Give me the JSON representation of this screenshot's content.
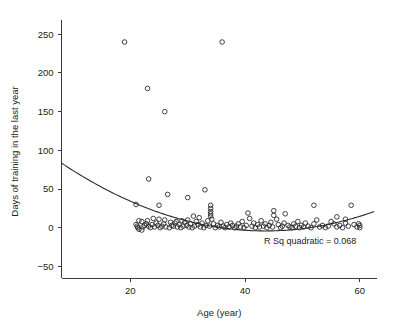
{
  "chart_data": {
    "type": "scatter",
    "title": "",
    "xlabel": "Age (year)",
    "ylabel": "Days of training in the last year",
    "xlim": [
      8,
      63
    ],
    "ylim": [
      -65,
      262
    ],
    "xticks": [
      20,
      40,
      60
    ],
    "yticks": [
      -50,
      0,
      50,
      100,
      150,
      200,
      250
    ],
    "grid": false,
    "legend": null,
    "annotation": "R Sq quadratic = 0.068",
    "marker": "open-circle",
    "fit": {
      "kind": "quadratic",
      "r_squared": 0.068,
      "label": "R Sq quadratic = 0.068",
      "coefficients": {
        "a": 0.0695,
        "b": -6.05,
        "c": 127.5
      },
      "x_start": 8,
      "x_end": 62.5
    },
    "points": [
      [
        19.0,
        240
      ],
      [
        36.0,
        240
      ],
      [
        23.0,
        180
      ],
      [
        26.0,
        150
      ],
      [
        23.2,
        63
      ],
      [
        33.0,
        49
      ],
      [
        26.5,
        43
      ],
      [
        30.0,
        39
      ],
      [
        21.0,
        30
      ],
      [
        25.0,
        29
      ],
      [
        34.0,
        29
      ],
      [
        34.0,
        25
      ],
      [
        34.0,
        21
      ],
      [
        34.0,
        18
      ],
      [
        34.0,
        15
      ],
      [
        40.5,
        19
      ],
      [
        45.0,
        22
      ],
      [
        45.0,
        16
      ],
      [
        47.0,
        18
      ],
      [
        52.0,
        29
      ],
      [
        58.5,
        29
      ],
      [
        56.0,
        14
      ],
      [
        57.5,
        11
      ],
      [
        31.0,
        15
      ],
      [
        32.0,
        13
      ],
      [
        30.0,
        10
      ],
      [
        29.0,
        9
      ],
      [
        28.0,
        8
      ],
      [
        27.0,
        7
      ],
      [
        26.0,
        10
      ],
      [
        25.0,
        11
      ],
      [
        24.0,
        12
      ],
      [
        23.0,
        9
      ],
      [
        22.0,
        8
      ],
      [
        21.5,
        9
      ],
      [
        21.0,
        4
      ],
      [
        21.2,
        2
      ],
      [
        21.3,
        0
      ],
      [
        21.5,
        -2
      ],
      [
        22.0,
        -3
      ],
      [
        22.2,
        1
      ],
      [
        22.5,
        3
      ],
      [
        22.8,
        5
      ],
      [
        23.2,
        2
      ],
      [
        23.5,
        0
      ],
      [
        23.8,
        4
      ],
      [
        24.2,
        1
      ],
      [
        24.5,
        6
      ],
      [
        24.8,
        3
      ],
      [
        25.2,
        0
      ],
      [
        25.5,
        2
      ],
      [
        25.8,
        5
      ],
      [
        26.2,
        1
      ],
      [
        26.8,
        0
      ],
      [
        27.2,
        3
      ],
      [
        27.5,
        2
      ],
      [
        27.8,
        6
      ],
      [
        28.2,
        1
      ],
      [
        28.5,
        4
      ],
      [
        28.8,
        0
      ],
      [
        29.2,
        2
      ],
      [
        29.5,
        7
      ],
      [
        29.8,
        3
      ],
      [
        30.2,
        1
      ],
      [
        30.5,
        5
      ],
      [
        30.8,
        0
      ],
      [
        31.2,
        2
      ],
      [
        31.5,
        8
      ],
      [
        31.8,
        4
      ],
      [
        32.2,
        1
      ],
      [
        32.5,
        6
      ],
      [
        32.8,
        0
      ],
      [
        33.2,
        3
      ],
      [
        33.5,
        9
      ],
      [
        33.8,
        2
      ],
      [
        34.2,
        11
      ],
      [
        34.5,
        5
      ],
      [
        34.8,
        0
      ],
      [
        35.2,
        3
      ],
      [
        35.5,
        1
      ],
      [
        35.8,
        7
      ],
      [
        36.2,
        2
      ],
      [
        36.5,
        0
      ],
      [
        36.8,
        4
      ],
      [
        37.2,
        1
      ],
      [
        37.5,
        6
      ],
      [
        37.8,
        3
      ],
      [
        38.2,
        0
      ],
      [
        38.5,
        2
      ],
      [
        38.8,
        5
      ],
      [
        39.2,
        1
      ],
      [
        39.5,
        8
      ],
      [
        39.8,
        0
      ],
      [
        40.2,
        3
      ],
      [
        40.8,
        12
      ],
      [
        41.2,
        2
      ],
      [
        41.5,
        6
      ],
      [
        41.8,
        0
      ],
      [
        42.2,
        4
      ],
      [
        42.5,
        1
      ],
      [
        42.8,
        9
      ],
      [
        43.2,
        2
      ],
      [
        43.5,
        5
      ],
      [
        43.8,
        0
      ],
      [
        44.2,
        3
      ],
      [
        44.5,
        7
      ],
      [
        44.8,
        1
      ],
      [
        45.5,
        11
      ],
      [
        45.8,
        4
      ],
      [
        46.2,
        0
      ],
      [
        46.5,
        2
      ],
      [
        46.8,
        6
      ],
      [
        47.5,
        3
      ],
      [
        47.8,
        1
      ],
      [
        48.2,
        0
      ],
      [
        48.5,
        5
      ],
      [
        48.8,
        2
      ],
      [
        49.2,
        8
      ],
      [
        49.5,
        0
      ],
      [
        49.8,
        3
      ],
      [
        50.2,
        1
      ],
      [
        50.5,
        6
      ],
      [
        51.0,
        2
      ],
      [
        51.5,
        0
      ],
      [
        52.0,
        5
      ],
      [
        52.5,
        10
      ],
      [
        53.0,
        1
      ],
      [
        53.5,
        3
      ],
      [
        54.0,
        0
      ],
      [
        54.5,
        2
      ],
      [
        55.0,
        8
      ],
      [
        55.5,
        5
      ],
      [
        56.0,
        1
      ],
      [
        56.5,
        3
      ],
      [
        57.0,
        0
      ],
      [
        57.5,
        6
      ],
      [
        58.0,
        2
      ],
      [
        59.0,
        4
      ],
      [
        59.5,
        1
      ],
      [
        60.0,
        0
      ],
      [
        60.0,
        3
      ],
      [
        59.8,
        5
      ]
    ]
  },
  "colors": {
    "axis": "#3a3a3a",
    "marker_stroke": "#2b2b2b",
    "curve": "#2b2b2b",
    "text": "#1a1a1a",
    "background": "#ffffff"
  }
}
